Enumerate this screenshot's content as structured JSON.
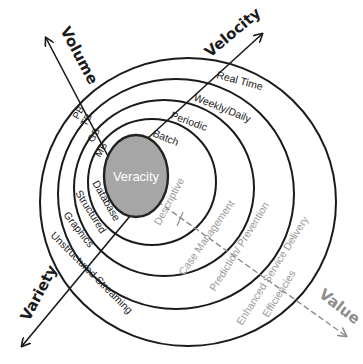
{
  "diagram": {
    "center": {
      "label": "Veracity",
      "fill": "#a6a6a6",
      "stroke": "#222222",
      "text_color": "#ffffff"
    },
    "axes": {
      "volume": {
        "label": "Volume",
        "color": "#1a1a1a",
        "levels": [
          "MB",
          "GB",
          "TB",
          "PB"
        ]
      },
      "velocity": {
        "label": "Velocity",
        "color": "#1a1a1a",
        "levels": [
          "Batch",
          "Periodic",
          "Weekly/Daily",
          "Real Time"
        ]
      },
      "variety": {
        "label": "Variety",
        "color": "#1a1a1a",
        "levels": [
          "Database",
          "Structured",
          "Graphics",
          "Unstructured Streaming"
        ]
      },
      "value": {
        "label": "Value",
        "color": "#8c8c8c",
        "levels": [
          "Descriptive",
          "Case Management",
          "Prediction/ Prevention",
          "Enhanced Service Delivery",
          "Efficiencies"
        ]
      }
    },
    "ring_color": "#1a1a1a",
    "value_text_color": "#9a9a9a"
  }
}
